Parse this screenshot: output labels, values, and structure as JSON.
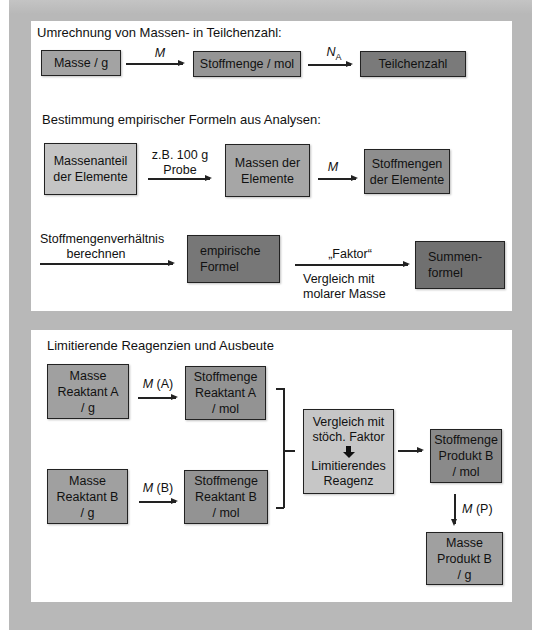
{
  "page": {
    "clipped_top_text": "g... ..."
  },
  "section1": {
    "title": "Umrechnung von Massen-  in Teilchenzahl:",
    "row1": {
      "boxes": [
        {
          "label": "Masse / g",
          "color": "#a3a3a3"
        },
        {
          "label": "Stoffmenge / mol",
          "color": "#959595"
        },
        {
          "label": "Teilchenzahl",
          "color": "#7a7a7a"
        }
      ],
      "arrows": [
        {
          "label": "M"
        },
        {
          "label": "N",
          "subscript": "A"
        }
      ]
    },
    "subtitle": "Bestimmung empirischer  Formeln aus Analysen:",
    "row2": {
      "boxes": [
        {
          "label": "Massenanteil\nder Elemente",
          "color": "#c4c4c4"
        },
        {
          "label": "Massen der\nElemente",
          "color": "#a6a6a6"
        },
        {
          "label": "Stoffmengen\nder Elemente",
          "color": "#8e8e8e"
        }
      ],
      "arrows": [
        {
          "label": "z.B. 100 g\nProbe"
        },
        {
          "label": "M"
        }
      ]
    },
    "row3": {
      "lead_label": "Stoffmengenverhältnis\nberechnen",
      "boxes": [
        {
          "label": "empirische\nFormel",
          "color": "#777777"
        },
        {
          "label": "Summen-\nformel",
          "color": "#707070"
        }
      ],
      "arrow": {
        "label_above": "„Faktor“",
        "label_below": "Vergleich mit\nmolarer Masse"
      }
    }
  },
  "section2": {
    "title": "Limitierende Reagenzien und Ausbeute",
    "boxes": {
      "mass_a": {
        "label": "Masse\nReaktant  A\n/ g",
        "color": "#a0a0a0"
      },
      "mol_a": {
        "label": "Stoffmenge\nReaktant  A\n/ mol",
        "color": "#939393"
      },
      "mass_b": {
        "label": "Masse\nReaktant  B\n/ g",
        "color": "#a0a0a0"
      },
      "mol_b": {
        "label": "Stoffmenge\nReaktant  B\n/ mol",
        "color": "#939393"
      },
      "compare": {
        "line1": "Vergleich mit\nstöch. Faktor",
        "line2": "Limitierendes\nReagenz",
        "color": "#c6c6c6"
      },
      "mol_p": {
        "label": "Stoffmenge\nProdukt  B\n/ mol",
        "color": "#8a8a8a"
      },
      "mass_p": {
        "label": "Masse\nProdukt  B\n/ g",
        "color": "#a0a0a0"
      }
    },
    "arrows": {
      "a": {
        "italic": "M",
        "rest": " (A)"
      },
      "b": {
        "italic": "M",
        "rest": " (B)"
      },
      "p": {
        "italic": "M",
        "rest": " (P)"
      }
    }
  },
  "colors": {
    "background_outer": "#b8b8b8",
    "panel": "#ffffff",
    "border": "#222222"
  }
}
